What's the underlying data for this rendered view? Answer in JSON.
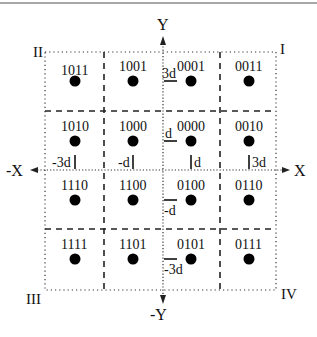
{
  "diagram": {
    "type": "16-QAM constellation with Gray-coded labels",
    "axes": {
      "x_pos": "X",
      "x_neg": "-X",
      "y_pos": "Y",
      "y_neg": "-Y"
    },
    "quadrants": {
      "q1": "I",
      "q2": "II",
      "q3": "III",
      "q4": "IV"
    },
    "x_ticks": [
      {
        "label": "-3d",
        "value": -3
      },
      {
        "label": "-d",
        "value": -1
      },
      {
        "label": "d",
        "value": 1
      },
      {
        "label": "3d",
        "value": 3
      }
    ],
    "y_ticks": [
      {
        "label": "3d",
        "value": 3
      },
      {
        "label": "d",
        "value": 1
      },
      {
        "label": "-d",
        "value": -1
      },
      {
        "label": "-3d",
        "value": -3
      }
    ],
    "points": [
      {
        "label": "1011",
        "x": -3,
        "y": 3
      },
      {
        "label": "1001",
        "x": -1,
        "y": 3
      },
      {
        "label": "0001",
        "x": 1,
        "y": 3
      },
      {
        "label": "0011",
        "x": 3,
        "y": 3
      },
      {
        "label": "1010",
        "x": -3,
        "y": 1
      },
      {
        "label": "1000",
        "x": -1,
        "y": 1
      },
      {
        "label": "0000",
        "x": 1,
        "y": 1
      },
      {
        "label": "0010",
        "x": 3,
        "y": 1
      },
      {
        "label": "1110",
        "x": -3,
        "y": -1
      },
      {
        "label": "1100",
        "x": -1,
        "y": -1
      },
      {
        "label": "0100",
        "x": 1,
        "y": -1
      },
      {
        "label": "0110",
        "x": 3,
        "y": -1
      },
      {
        "label": "1111",
        "x": -3,
        "y": -3
      },
      {
        "label": "1101",
        "x": -1,
        "y": -3
      },
      {
        "label": "0101",
        "x": 1,
        "y": -3
      },
      {
        "label": "0111",
        "x": 3,
        "y": -3
      }
    ]
  }
}
